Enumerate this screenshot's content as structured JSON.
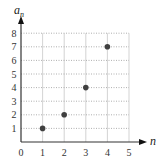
{
  "chart_data": {
    "type": "scatter",
    "title": "",
    "xlabel": "n",
    "ylabel": "a",
    "ylabel_subscript": "n",
    "x": [
      1,
      2,
      3,
      4
    ],
    "y": [
      1,
      2,
      4,
      7
    ],
    "series": [
      {
        "name": "a_n",
        "points": [
          [
            1,
            1
          ],
          [
            2,
            2
          ],
          [
            3,
            4
          ],
          [
            4,
            7
          ]
        ],
        "color": "#404040"
      }
    ],
    "xlim": [
      0,
      5
    ],
    "ylim": [
      0,
      8
    ],
    "x_ticks": [
      "0",
      "1",
      "2",
      "3",
      "4",
      "5"
    ],
    "y_ticks": [
      "1",
      "2",
      "3",
      "4",
      "5",
      "6",
      "7",
      "8"
    ],
    "grid": true,
    "legend": "none"
  },
  "colors": {
    "axis": "#333333",
    "grid": "#c8c8c8",
    "point": "#404040"
  }
}
